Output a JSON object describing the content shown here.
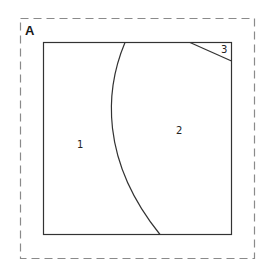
{
  "panel": {
    "label": "A",
    "border_style": "dashed",
    "border_color": "#888888"
  },
  "square": {
    "stroke_color": "#333333"
  },
  "regions": [
    {
      "id": "1",
      "label": "1"
    },
    {
      "id": "2",
      "label": "2"
    },
    {
      "id": "3",
      "label": "3"
    }
  ]
}
